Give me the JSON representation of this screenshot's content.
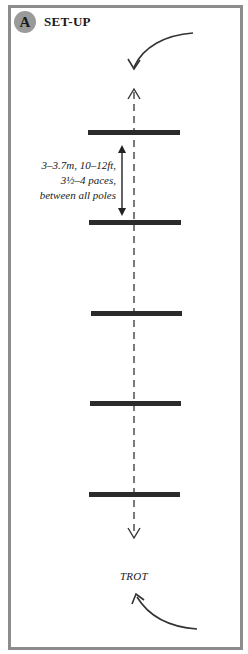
{
  "header": {
    "badge": "A",
    "title": "SET-UP"
  },
  "measurement": {
    "lines": [
      "3–3.7m, 10–12ft,",
      "3½–4 paces,",
      "between all poles"
    ]
  },
  "gait": "TROT",
  "poles": {
    "count": 5,
    "y_positions": [
      133,
      223,
      314,
      404,
      495
    ]
  },
  "colors": {
    "frame": "#8c8c8c",
    "badge": "#9a9a9a",
    "pole": "#2b2b2b",
    "line": "#333333"
  }
}
